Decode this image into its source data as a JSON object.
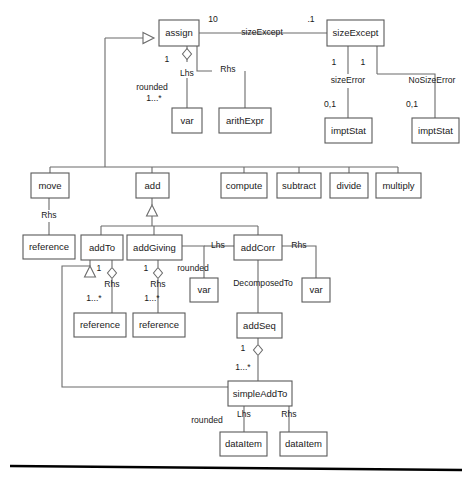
{
  "diagram": {
    "kind": "uml-class-diagram",
    "background": "#ffffff",
    "box_stroke": "#5a5a5a",
    "edge_stroke": "#6b6b6b",
    "text_color": "#1a1a1a",
    "footer_rule_color": "#000000",
    "classes": [
      {
        "id": "assign",
        "label": "assign",
        "x": 159,
        "y": 20,
        "w": 40,
        "h": 26
      },
      {
        "id": "sizeExcept",
        "label": "sizeExcept",
        "x": 327,
        "y": 20,
        "w": 57,
        "h": 26
      },
      {
        "id": "var_lhs",
        "label": "var",
        "x": 172,
        "y": 108,
        "w": 30,
        "h": 25
      },
      {
        "id": "arithExpr",
        "label": "arithExpr",
        "x": 219,
        "y": 108,
        "w": 52,
        "h": 25
      },
      {
        "id": "imptStat_l",
        "label": "imptStat",
        "x": 325,
        "y": 118,
        "w": 47,
        "h": 25
      },
      {
        "id": "imptStat_r",
        "label": "imptStat",
        "x": 412,
        "y": 118,
        "w": 47,
        "h": 25
      },
      {
        "id": "move",
        "label": "move",
        "x": 31,
        "y": 173,
        "w": 38,
        "h": 25
      },
      {
        "id": "add",
        "label": "add",
        "x": 136,
        "y": 173,
        "w": 33,
        "h": 25
      },
      {
        "id": "compute",
        "label": "compute",
        "x": 221,
        "y": 173,
        "w": 46,
        "h": 25
      },
      {
        "id": "subtract",
        "label": "subtract",
        "x": 277,
        "y": 173,
        "w": 44,
        "h": 25
      },
      {
        "id": "divide",
        "label": "divide",
        "x": 330,
        "y": 173,
        "w": 38,
        "h": 25
      },
      {
        "id": "multiply",
        "label": "multiply",
        "x": 376,
        "y": 173,
        "w": 45,
        "h": 25
      },
      {
        "id": "reference_m",
        "label": "reference",
        "x": 23,
        "y": 235,
        "w": 52,
        "h": 24
      },
      {
        "id": "addTo",
        "label": "addTo",
        "x": 81,
        "y": 235,
        "w": 42,
        "h": 25
      },
      {
        "id": "addGiving",
        "label": "addGiving",
        "x": 127,
        "y": 235,
        "w": 55,
        "h": 25
      },
      {
        "id": "addCorr",
        "label": "addCorr",
        "x": 234,
        "y": 235,
        "w": 48,
        "h": 25
      },
      {
        "id": "var_corr_l",
        "label": "var",
        "x": 190,
        "y": 278,
        "w": 28,
        "h": 24
      },
      {
        "id": "var_corr_r",
        "label": "var",
        "x": 302,
        "y": 278,
        "w": 28,
        "h": 24
      },
      {
        "id": "reference_a",
        "label": "reference",
        "x": 74,
        "y": 313,
        "w": 52,
        "h": 24
      },
      {
        "id": "reference_b",
        "label": "reference",
        "x": 133,
        "y": 313,
        "w": 52,
        "h": 24
      },
      {
        "id": "addSeq",
        "label": "addSeq",
        "x": 237,
        "y": 313,
        "w": 45,
        "h": 25
      },
      {
        "id": "simpleAddTo",
        "label": "simpleAddTo",
        "x": 228,
        "y": 381,
        "w": 64,
        "h": 25
      },
      {
        "id": "dataItem_l",
        "label": "dataItem",
        "x": 220,
        "y": 432,
        "w": 47,
        "h": 24
      },
      {
        "id": "dataItem_r",
        "label": "dataItem",
        "x": 280,
        "y": 432,
        "w": 47,
        "h": 24
      }
    ],
    "role_labels": [
      {
        "id": "r-sizeexcept",
        "text": "sizeExcept",
        "x": 262,
        "y": 33
      },
      {
        "id": "r-lhs-assign",
        "text": "Lhs",
        "x": 187,
        "y": 74
      },
      {
        "id": "r-rhs-assign",
        "text": "Rhs",
        "x": 228,
        "y": 70
      },
      {
        "id": "r-rounded-assign",
        "text": "rounded",
        "x": 152,
        "y": 88
      },
      {
        "id": "r-sizeerror",
        "text": "sizeError",
        "x": 348,
        "y": 81
      },
      {
        "id": "r-nosizeerror",
        "text": "NoSizeError",
        "x": 432,
        "y": 81
      },
      {
        "id": "r-rhs-move",
        "text": "Rhs",
        "x": 49,
        "y": 216
      },
      {
        "id": "r-rhs-addto",
        "text": "Rhs",
        "x": 112,
        "y": 285
      },
      {
        "id": "r-rhs-addgiving",
        "text": "Rhs",
        "x": 158,
        "y": 285
      },
      {
        "id": "r-rounded-addg",
        "text": "rounded",
        "x": 193,
        "y": 269
      },
      {
        "id": "r-lhs-addcorr",
        "text": "Lhs",
        "x": 218,
        "y": 246
      },
      {
        "id": "r-rhs-addcorr",
        "text": "Rhs",
        "x": 299,
        "y": 246
      },
      {
        "id": "r-decomposedto",
        "text": "DecomposedTo",
        "x": 263,
        "y": 284
      },
      {
        "id": "r-rounded-simple",
        "text": "rounded",
        "x": 207,
        "y": 421
      },
      {
        "id": "r-lhs-simple",
        "text": "Lhs",
        "x": 244,
        "y": 415
      },
      {
        "id": "r-rhs-simple",
        "text": "Rhs",
        "x": 289,
        "y": 415
      }
    ],
    "multiplicities": [
      {
        "id": "m-assign-10",
        "text": "10",
        "x": 213,
        "y": 20
      },
      {
        "id": "m-sizeexcept-1",
        "text": ".1",
        "x": 311,
        "y": 20
      },
      {
        "id": "m-assign-lhs-1",
        "text": "1",
        "x": 167,
        "y": 60
      },
      {
        "id": "m-rounded-star",
        "text": "1...*",
        "x": 154,
        "y": 99
      },
      {
        "id": "m-sizeerror-1",
        "text": "1",
        "x": 334,
        "y": 63
      },
      {
        "id": "m-nosizeerror-1",
        "text": "1",
        "x": 363,
        "y": 63
      },
      {
        "id": "m-sizeerror-01",
        "text": "0,1",
        "x": 330,
        "y": 105
      },
      {
        "id": "m-nosizeerror-01",
        "text": "0,1",
        "x": 412,
        "y": 105
      },
      {
        "id": "m-addto-1",
        "text": "1",
        "x": 99,
        "y": 269
      },
      {
        "id": "m-addgiving-1",
        "text": "1",
        "x": 146,
        "y": 269
      },
      {
        "id": "m-addto-star",
        "text": "1...*",
        "x": 94,
        "y": 299
      },
      {
        "id": "m-addgiving-star",
        "text": "1...*",
        "x": 152,
        "y": 299
      },
      {
        "id": "m-addseq-1",
        "text": "1",
        "x": 243,
        "y": 349
      },
      {
        "id": "m-addseq-star",
        "text": "1...*",
        "x": 243,
        "y": 368
      }
    ],
    "edges": [
      {
        "id": "e-assign-sizeexcept",
        "points": "199,33 327,33"
      },
      {
        "id": "e-assign-lhs",
        "points": "187,46 187,62"
      },
      {
        "id": "e-lhs-var",
        "points": "187,78 187,108"
      },
      {
        "id": "e-assign-rhs-v",
        "points": "197,46 197,71 212,71"
      },
      {
        "id": "e-rhs-arithexpr",
        "points": "245,71 245,108"
      },
      {
        "id": "e-sizeerror",
        "points": "348,46 348,74"
      },
      {
        "id": "e-sizeerror-impt",
        "points": "348,88 348,118"
      },
      {
        "id": "e-nosizeerror",
        "points": "377,46 377,74"
      },
      {
        "id": "e-nosize-impt",
        "points": "435,88 435,118"
      },
      {
        "id": "e-nosize-bend",
        "points": "377,74 435,74 435,88"
      },
      {
        "id": "e-gen-left-route",
        "points": "105,38 105,167"
      },
      {
        "id": "e-gen-left-arrow",
        "points": "105,38 143,38"
      },
      {
        "id": "e-gen-bus",
        "points": "50,167 398,167"
      },
      {
        "id": "e-bus-move",
        "points": "50,167 50,173"
      },
      {
        "id": "e-bus-add",
        "points": "152,167 152,173"
      },
      {
        "id": "e-bus-compute",
        "points": "244,167 244,173"
      },
      {
        "id": "e-bus-subtract",
        "points": "299,167 299,173"
      },
      {
        "id": "e-bus-divide",
        "points": "349,167 349,173"
      },
      {
        "id": "e-bus-multiply",
        "points": "398,167 398,173"
      },
      {
        "id": "e-move-rhs",
        "points": "49,198 49,210"
      },
      {
        "id": "e-rhs-reference",
        "points": "49,222 49,235"
      },
      {
        "id": "e-add-gen-stem",
        "points": "152,198 152,205"
      },
      {
        "id": "e-add-gen-down",
        "points": "152,216 152,226"
      },
      {
        "id": "e-sub-bus",
        "points": "101,226 258,226"
      },
      {
        "id": "e-sub-addto",
        "points": "101,226 101,235"
      },
      {
        "id": "e-sub-addgiving",
        "points": "154,226 154,235"
      },
      {
        "id": "e-sub-addcorr",
        "points": "258,226 258,235"
      },
      {
        "id": "e-addto-gen-stem",
        "points": "90,260 90,266"
      },
      {
        "id": "e-addto-agg",
        "points": "112,260 112,267"
      },
      {
        "id": "e-addto-rhs",
        "points": "112,279 112,292"
      },
      {
        "id": "e-addto-ref",
        "points": "112,292 112,313"
      },
      {
        "id": "e-addg-agg",
        "points": "158,260 158,267"
      },
      {
        "id": "e-addg-rhs",
        "points": "158,279 158,292"
      },
      {
        "id": "e-addg-ref",
        "points": "158,292 158,313"
      },
      {
        "id": "e-addg-rounded",
        "points": "182,246 204,246 204,278"
      },
      {
        "id": "e-addcorr-lhs",
        "points": "234,246 204,246"
      },
      {
        "id": "e-addcorr-rhs",
        "points": "282,246 316,246 316,278"
      },
      {
        "id": "e-addcorr-decomp",
        "points": "258,260 258,313"
      },
      {
        "id": "e-addseq-agg",
        "points": "258,338 258,344"
      },
      {
        "id": "e-addseq-simple",
        "points": "258,356 258,381"
      },
      {
        "id": "e-simple-gen-route",
        "points": "90,266 62,266 62,387 228,387"
      },
      {
        "id": "e-simple-lhs",
        "points": "244,406 244,420"
      },
      {
        "id": "e-simple-lhs-item",
        "points": "244,420 244,432"
      },
      {
        "id": "e-simple-rhs",
        "points": "289,406 289,420"
      },
      {
        "id": "e-simple-rhs-item",
        "points": "289,420 289,432"
      }
    ],
    "generalization_triangles": [
      {
        "id": "gen-assign",
        "orientation": "right",
        "x": 143,
        "y": 38,
        "size": 11
      },
      {
        "id": "gen-add",
        "orientation": "up",
        "x": 152,
        "y": 205,
        "size": 11
      },
      {
        "id": "gen-addto",
        "orientation": "up",
        "x": 90,
        "y": 266,
        "size": 11
      }
    ],
    "aggregation_diamonds": [
      {
        "id": "agg-assign-lhs",
        "x": 187,
        "y": 54,
        "w": 9,
        "h": 11
      },
      {
        "id": "agg-addto",
        "x": 112,
        "y": 273,
        "w": 9,
        "h": 11
      },
      {
        "id": "agg-addgiving",
        "x": 158,
        "y": 273,
        "w": 9,
        "h": 11
      },
      {
        "id": "agg-addseq",
        "x": 258,
        "y": 350,
        "w": 9,
        "h": 11
      }
    ],
    "footer_rule": {
      "id": "footer-rule",
      "x1": 10,
      "y1": 466,
      "x2": 462,
      "y2": 470
    }
  }
}
